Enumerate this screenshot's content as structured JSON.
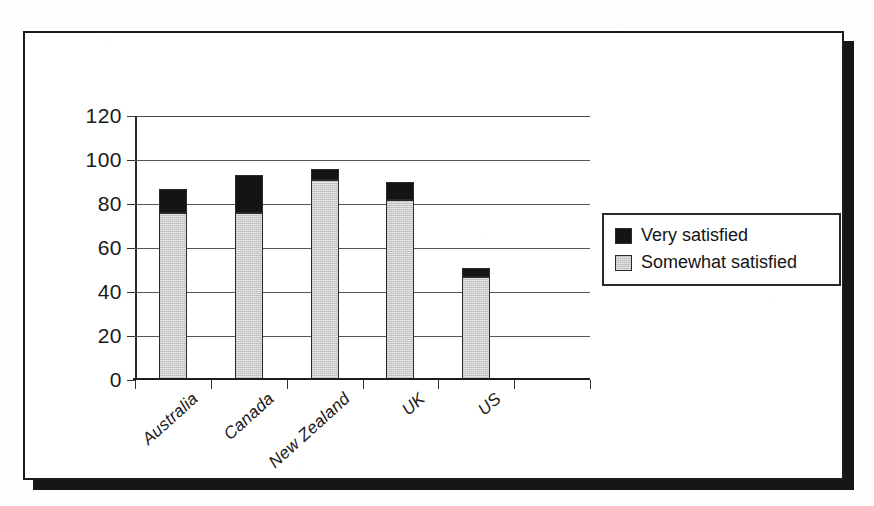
{
  "chart_data": {
    "type": "bar",
    "stacked": true,
    "title": "",
    "xlabel": "",
    "ylabel": "",
    "categories": [
      "Australia",
      "Canada",
      "New Zealand",
      "UK",
      "US"
    ],
    "series": [
      {
        "name": "Somewhat satisfied",
        "color": "#c9c9c9",
        "values": [
          76,
          76,
          91,
          82,
          47
        ]
      },
      {
        "name": "Very satisfied",
        "color": "#141414",
        "values": [
          11,
          17,
          5,
          8,
          4
        ]
      }
    ],
    "totals": [
      87,
      93,
      96,
      90,
      51
    ],
    "ylim": [
      0,
      120
    ],
    "yticks": [
      0,
      20,
      40,
      60,
      80,
      100,
      120
    ],
    "ytick_labels": [
      "0",
      "20",
      "40",
      "60",
      "80",
      "100",
      "120"
    ],
    "grid": true,
    "legend_position": "right"
  },
  "legend": {
    "items": [
      {
        "label": "Very satisfied",
        "swatch": "black-square-swatch"
      },
      {
        "label": "Somewhat satisfied",
        "swatch": "gray-square-swatch"
      }
    ]
  },
  "colors": {
    "very_satisfied": "#141414",
    "somewhat_satisfied": "#c9c9c9",
    "frame": "#1c1c1c",
    "gridline": "#555555",
    "page_background": "#ffffff"
  }
}
